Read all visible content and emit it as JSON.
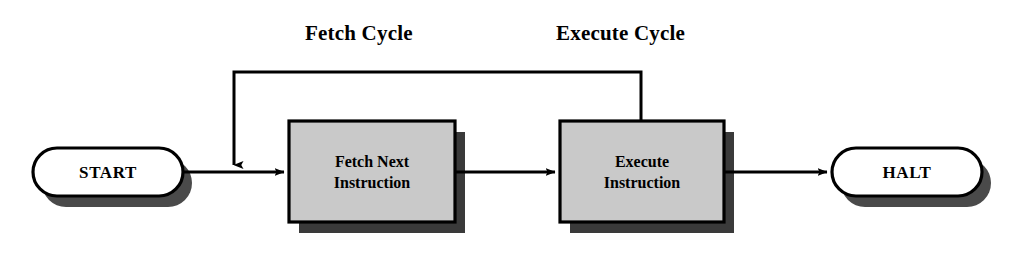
{
  "diagram": {
    "background_color": "#ffffff",
    "line_color": "#000000",
    "process_fill": "#c9c9c9",
    "process_shadow": "#3a3a3a",
    "terminator_fill": "#ffffff",
    "terminator_shadow": "#4a4a4a",
    "labels": {
      "fetch_cycle": "Fetch Cycle",
      "execute_cycle": "Execute Cycle"
    },
    "nodes": {
      "start": {
        "label": "START",
        "type": "terminator"
      },
      "fetch": {
        "label_line1": "Fetch Next",
        "label_line2": "Instruction",
        "type": "process"
      },
      "execute": {
        "label_line1": "Execute",
        "label_line2": "Instruction",
        "type": "process"
      },
      "halt": {
        "label": "HALT",
        "type": "terminator"
      }
    },
    "edges": [
      {
        "from": "start",
        "to": "fetch",
        "arrow": true
      },
      {
        "from": "fetch",
        "to": "execute",
        "arrow": true
      },
      {
        "from": "execute",
        "to": "halt",
        "arrow": true
      },
      {
        "from": "execute",
        "to": "fetch",
        "arrow": true,
        "style": "feedback-loop"
      }
    ]
  }
}
